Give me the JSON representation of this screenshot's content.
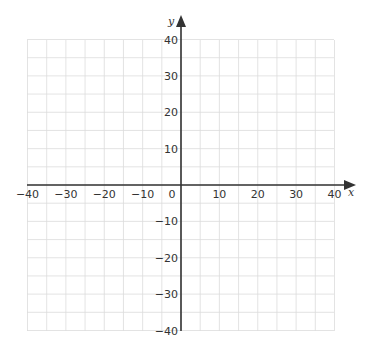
{
  "chart_data": {
    "type": "coordinate-grid",
    "xlabel": "x",
    "ylabel": "y",
    "xlim": [
      -40,
      40
    ],
    "ylim": [
      -40,
      40
    ],
    "grid": true,
    "grid_step": 5,
    "x_ticks": [
      -40,
      -30,
      -20,
      -10,
      0,
      10,
      20,
      30,
      40
    ],
    "y_ticks": [
      -40,
      -30,
      -20,
      -10,
      10,
      20,
      30,
      40
    ],
    "x_tick_labels": [
      "−40",
      "−30",
      "−20",
      "−10",
      "0",
      "10",
      "20",
      "30",
      "40"
    ],
    "y_tick_labels": [
      "−40",
      "−30",
      "−20",
      "−10",
      "10",
      "20",
      "30",
      "40"
    ],
    "series": []
  },
  "axes": {
    "x_label": "x",
    "y_label": "y",
    "origin_label": "0"
  },
  "colors": {
    "grid": "#dcdcdc",
    "axis": "#333333",
    "text": "#333333"
  }
}
